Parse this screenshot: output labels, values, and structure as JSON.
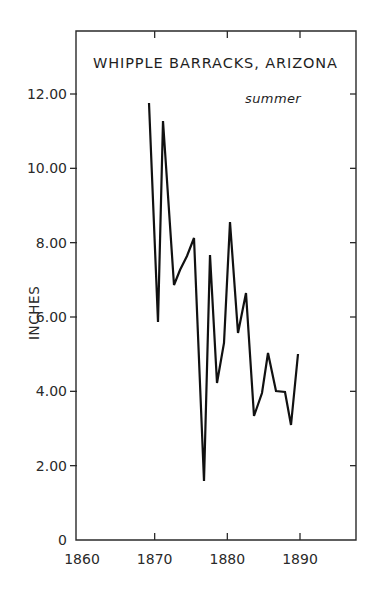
{
  "chart_data": {
    "type": "line",
    "title": "WHIPPLE BARRACKS, ARIZONA",
    "subtitle": "summer",
    "xlabel": "",
    "ylabel": "INCHES",
    "xlim": [
      1860,
      1897
    ],
    "ylim": [
      0,
      13.8
    ],
    "x_ticks": [
      1860,
      1870,
      1880,
      1890
    ],
    "x_tick_labels": [
      "1860",
      "1870",
      "1880",
      "1890"
    ],
    "y_ticks": [
      0,
      2,
      4,
      6,
      8,
      10,
      12
    ],
    "y_tick_labels": [
      "0",
      "2.00",
      "4.00",
      "6.00",
      "8.00",
      "10.00",
      "12.00"
    ],
    "grid": false,
    "legend": null,
    "series": [
      {
        "name": "summer precipitation",
        "x": [
          1869,
          1870,
          1871,
          1872,
          1873,
          1874,
          1875,
          1876,
          1877,
          1878,
          1879,
          1880,
          1881,
          1882,
          1883,
          1884,
          1885,
          1886,
          1887,
          1888,
          1889,
          1890
        ],
        "values": [
          11.75,
          5.86,
          11.26,
          6.85,
          7.3,
          7.6,
          8.12,
          1.59,
          7.66,
          4.22,
          5.3,
          8.56,
          5.56,
          6.63,
          3.33,
          3.95,
          5.04,
          3.98,
          3.98,
          3.98,
          3.09,
          5.0
        ]
      }
    ]
  },
  "plot": {
    "frame": {
      "left": 76,
      "right": 356,
      "top": 31,
      "bottom": 540
    },
    "x_px": {
      "x0": 1860,
      "px0": 82,
      "x1": 1890,
      "px1": 300
    },
    "y_px": {
      "y0": 0,
      "py0": 540,
      "y1": 12,
      "py1": 94
    },
    "line_color": "#111111",
    "axis_color": "#2a2a2a",
    "vertices_px": [
      [
        149,
        103
      ],
      [
        158,
        322
      ],
      [
        163,
        121
      ],
      [
        174,
        285
      ],
      [
        180,
        270
      ],
      [
        187,
        256
      ],
      [
        194,
        238
      ],
      [
        204,
        481
      ],
      [
        210,
        255
      ],
      [
        217,
        383
      ],
      [
        224,
        343
      ],
      [
        230,
        222
      ],
      [
        238,
        333
      ],
      [
        246,
        293
      ],
      [
        254,
        416
      ],
      [
        262,
        393
      ],
      [
        268,
        353
      ],
      [
        276,
        391
      ],
      [
        285,
        392
      ],
      [
        291,
        425
      ],
      [
        298,
        354
      ]
    ]
  }
}
